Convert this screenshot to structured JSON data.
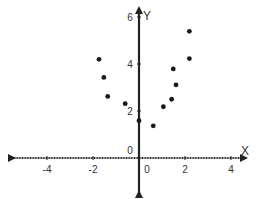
{
  "chart_data": {
    "type": "scatter",
    "title": "",
    "xlabel": "X",
    "ylabel": "Y",
    "xlim": [
      -5.5,
      5
    ],
    "ylim": [
      -1.5,
      6.5
    ],
    "x_ticks": [
      -4,
      -2,
      0,
      2,
      4
    ],
    "x_tick_labels": [
      "-4",
      "-2",
      "0",
      "2",
      "4"
    ],
    "y_ticks": [
      0,
      2,
      4,
      6
    ],
    "y_tick_labels": [
      "0",
      "2",
      "4",
      "6"
    ],
    "grid": false,
    "legend": null,
    "points": [
      {
        "x": -1.74,
        "y": 4.2
      },
      {
        "x": -1.53,
        "y": 3.43
      },
      {
        "x": -1.36,
        "y": 2.62
      },
      {
        "x": -0.6,
        "y": 2.31
      },
      {
        "x": 0.0,
        "y": 1.59
      },
      {
        "x": 0.62,
        "y": 1.37
      },
      {
        "x": 1.06,
        "y": 2.18
      },
      {
        "x": 1.42,
        "y": 2.5
      },
      {
        "x": 1.49,
        "y": 3.79
      },
      {
        "x": 1.61,
        "y": 3.11
      },
      {
        "x": 2.19,
        "y": 4.23
      },
      {
        "x": 2.19,
        "y": 5.39
      }
    ]
  },
  "colors": {
    "axis": "#222222",
    "point": "#1a1a1a",
    "label": "#333333"
  }
}
